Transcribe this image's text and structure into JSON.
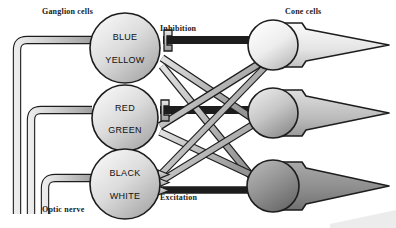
{
  "diagram": {
    "labels": {
      "ganglion_cells": "Ganglion cells",
      "cone_cells": "Cone cells",
      "inhibition": "Inhibition",
      "excitation": "Excitation",
      "optic_nerve": "Optic nerve"
    },
    "ganglion_cells": [
      {
        "id": "blue-yellow",
        "top_label": "BLUE",
        "bottom_label": "YELLOW",
        "cx": 125,
        "cy": 48,
        "r": 35
      },
      {
        "id": "red-green",
        "top_label": "RED",
        "bottom_label": "GREEN",
        "cx": 125,
        "cy": 118,
        "r": 33
      },
      {
        "id": "black-white",
        "top_label": "BLACK",
        "bottom_label": "WHITE",
        "cx": 125,
        "cy": 184,
        "r": 35
      }
    ],
    "cone_cells": [
      {
        "id": "cone-1",
        "cx": 273,
        "cy": 45,
        "r": 25,
        "fill": "#f2f2f2",
        "tip_x": 389
      },
      {
        "id": "cone-2",
        "cx": 273,
        "cy": 113,
        "r": 25,
        "fill": "#c9c9c9",
        "tip_x": 389
      },
      {
        "id": "cone-3",
        "cx": 273,
        "cy": 186,
        "r": 26,
        "fill": "#8e8e8e",
        "tip_x": 389
      }
    ],
    "colors": {
      "ganglion_fill": "#d8d8d8",
      "outline": "#1d1d1d",
      "fiber_fill": "#b5b5b5",
      "background": "#ffffff"
    }
  }
}
